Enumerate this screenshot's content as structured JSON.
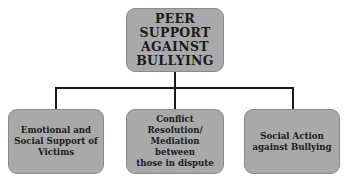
{
  "diagram": {
    "type": "hierarchy",
    "root": {
      "label": "PEER\nSUPPORT\nAGAINST\nBULLYING"
    },
    "children": [
      {
        "label": "Emotional and\nSocial Support of\nVictims"
      },
      {
        "label": "Conflict Resolution/\nMediation between\nthose in dispute"
      },
      {
        "label": "Social Action\nagainst Bullying"
      }
    ],
    "colors": {
      "box_fill": "#a9a9a9",
      "connector": "#1a1a1a",
      "text": "#1a1a1a",
      "background": "#ffffff"
    }
  }
}
